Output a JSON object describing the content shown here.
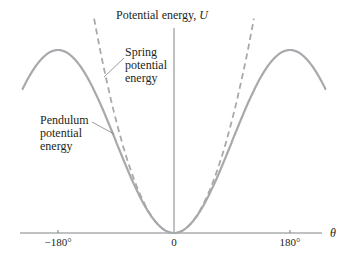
{
  "chart_data": {
    "type": "line",
    "title": "",
    "ylabel": "Potential energy, U",
    "xlabel": "θ",
    "x_ticks": [
      "−180°",
      "0",
      "180°"
    ],
    "x_tick_values": [
      -180,
      0,
      180
    ],
    "xlim": [
      -235,
      235
    ],
    "grid": false,
    "legend": "inline annotations",
    "series": [
      {
        "name": "Pendulum potential energy",
        "style": "solid",
        "formula": "U = 1 − cos(θ)",
        "x": [
          -235,
          -180,
          -135,
          -90,
          -45,
          0,
          45,
          90,
          135,
          180,
          235
        ],
        "values": [
          1.57,
          2.0,
          1.71,
          1.0,
          0.29,
          0.0,
          0.29,
          1.0,
          1.71,
          2.0,
          1.57
        ]
      },
      {
        "name": "Spring potential energy",
        "style": "dashed",
        "formula": "U = θ²/2",
        "x": [
          -115,
          -90,
          -45,
          0,
          45,
          90,
          115
        ],
        "values": [
          2.01,
          1.23,
          0.31,
          0.0,
          0.31,
          1.23,
          2.01
        ]
      }
    ],
    "annotations": [
      {
        "text": [
          "Spring",
          "potential",
          "energy"
        ],
        "points_to": "dashed curve"
      },
      {
        "text": [
          "Pendulum",
          "potential",
          "energy"
        ],
        "points_to": "solid curve"
      }
    ]
  },
  "colors": {
    "curve": "#a7a9ac",
    "axis": "#808285",
    "text": "#231f20"
  },
  "labels": {
    "y_axis": "Potential energy, ",
    "y_axis_var": "U",
    "x_axis": "θ",
    "tick_neg180": "−180°",
    "tick_0": "0",
    "tick_180": "180°",
    "spring": [
      "Spring",
      "potential",
      "energy"
    ],
    "pendulum": [
      "Pendulum",
      "potential",
      "energy"
    ]
  }
}
